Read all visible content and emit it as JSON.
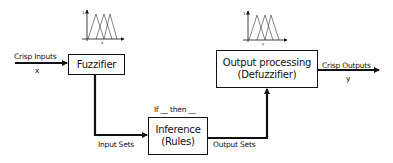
{
  "diagram": {
    "type": "fuzzy-logic-system-block-diagram",
    "blocks": {
      "fuzzifier": {
        "label": "Fuzzifier"
      },
      "inference": {
        "line1": "Inference",
        "line2": "(Rules)",
        "caption": "If __ then __"
      },
      "defuzzifier": {
        "line1": "Output processing",
        "line2": "(Defuzzifier)"
      }
    },
    "edges": {
      "crisp_inputs": {
        "label": "Crisp Inputs",
        "var": "x"
      },
      "input_sets": {
        "label": "Input Sets"
      },
      "output_sets": {
        "label": "Output Sets"
      },
      "crisp_outputs": {
        "label": "Crisp Outputs",
        "var": "y"
      }
    },
    "membership_plots": {
      "input": {
        "y_tick": "1",
        "x_label": "x"
      },
      "output": {
        "y_tick": "1",
        "x_label": "y"
      }
    },
    "colors": {
      "stroke": "#111111",
      "background": "#ffffff"
    }
  }
}
